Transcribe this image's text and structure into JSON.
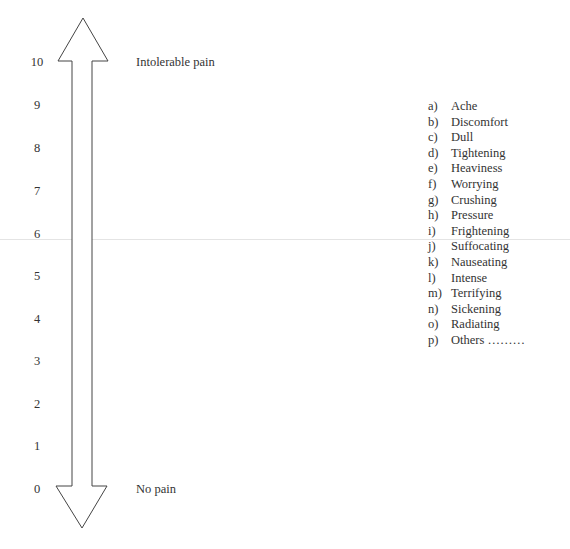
{
  "scale": {
    "ticks": [
      "10",
      "9",
      "8",
      "7",
      "6",
      "5",
      "4",
      "3",
      "2",
      "1",
      "0"
    ],
    "top_label": "Intolerable pain",
    "bottom_label": "No pain"
  },
  "descriptors": [
    {
      "letter": "a)",
      "text": "Ache"
    },
    {
      "letter": "b)",
      "text": "Discomfort"
    },
    {
      "letter": "c)",
      "text": "Dull"
    },
    {
      "letter": "d)",
      "text": "Tightening"
    },
    {
      "letter": "e)",
      "text": "Heaviness"
    },
    {
      "letter": "f)",
      "text": "Worrying"
    },
    {
      "letter": "g)",
      "text": "Crushing"
    },
    {
      "letter": "h)",
      "text": "Pressure"
    },
    {
      "letter": "i)",
      "text": "Frightening"
    },
    {
      "letter": "j)",
      "text": "Suffocating"
    },
    {
      "letter": "k)",
      "text": "Nauseating"
    },
    {
      "letter": "l)",
      "text": "Intense"
    },
    {
      "letter": "m)",
      "text": "Terrifying"
    },
    {
      "letter": "n)",
      "text": "Sickening"
    },
    {
      "letter": "o)",
      "text": "Radiating"
    },
    {
      "letter": "p)",
      "text": "Others ………"
    }
  ]
}
